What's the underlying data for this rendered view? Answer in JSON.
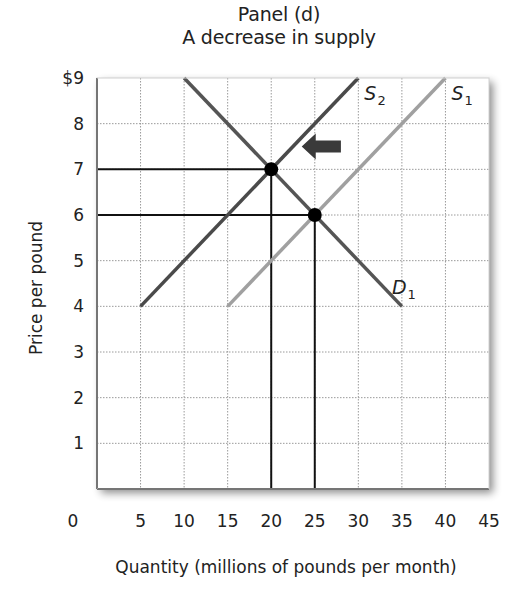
{
  "title": "Panel (d)",
  "subtitle": "A decrease in supply",
  "colors": {
    "frame": "#1a1a1a",
    "grid": "#9a9a9a",
    "demand": "#555555",
    "supply_original": "#a0a0a0",
    "supply_new": "#4a4a4a",
    "guides": "#111111",
    "equilibrium_point": "#000000",
    "arrow": "#3a3a3a",
    "shadow": "#bdbdbd"
  },
  "chart_data": {
    "type": "line",
    "title": "Panel (d)",
    "subtitle": "A decrease in supply",
    "xlabel": "Quantity (millions of pounds per month)",
    "ylabel": "Price per pound",
    "xlim": [
      0,
      45
    ],
    "ylim": [
      0,
      9
    ],
    "x_ticks": [
      "0",
      "5",
      "10",
      "15",
      "20",
      "25",
      "30",
      "35",
      "40",
      "45"
    ],
    "y_ticks": [
      "$9",
      "8",
      "7",
      "6",
      "5",
      "4",
      "3",
      "2",
      "1"
    ],
    "grid": true,
    "series": [
      {
        "name": "D1",
        "label_main": "D",
        "label_sub": "1",
        "points": [
          [
            10,
            9
          ],
          [
            35,
            4
          ]
        ]
      },
      {
        "name": "S1",
        "label_main": "S",
        "label_sub": "1",
        "points": [
          [
            15,
            4
          ],
          [
            40,
            9
          ]
        ]
      },
      {
        "name": "S2",
        "label_main": "S",
        "label_sub": "2",
        "points": [
          [
            5,
            4
          ],
          [
            30,
            9
          ]
        ]
      }
    ],
    "equilibria": [
      {
        "name": "initial",
        "quantity": 25,
        "price": 6
      },
      {
        "name": "new",
        "quantity": 20,
        "price": 7
      }
    ],
    "annotations": [
      {
        "type": "arrow",
        "direction": "left",
        "from": [
          28,
          7.5
        ],
        "to": [
          23.5,
          7.5
        ],
        "meaning": "supply shifts left from S1 to S2"
      }
    ]
  }
}
